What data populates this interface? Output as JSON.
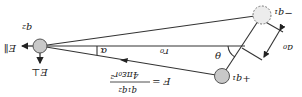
{
  "figure": {
    "rotation_deg": 180,
    "labels": {
      "q2": "q₂",
      "plus_q1": "+q₁",
      "minus_q1": "−q₁",
      "r0": "r₀",
      "a0": "a₀",
      "alpha": "α",
      "theta": "θ",
      "E_perp": "E⊥",
      "E_par": "E∥",
      "force_lhs": "F =",
      "force_num": "q₁q₂",
      "force_den": "4πε₀r²"
    },
    "colors": {
      "charge_fill": "#c8c8c8",
      "neg_charge_fill": "#ececec",
      "stroke": "#333333",
      "background": "#ffffff"
    }
  }
}
